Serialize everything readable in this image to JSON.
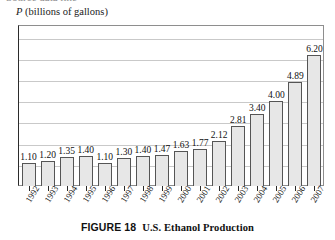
{
  "crop_strip": {
    "ghost_text": "Source data line"
  },
  "figure": {
    "label": "FIGURE 18",
    "caption": "U.S. Ethanol Production",
    "y_axis_title_symbol": "P",
    "y_axis_title_rest": " (billions of gallons)"
  },
  "style": {
    "bar_fill": "#e7e7e7",
    "bar_stroke": "#555555",
    "grid_color": "#c9c9c9",
    "axis_color": "#2b2b2b",
    "background": "#ffffff"
  },
  "chart_data": {
    "type": "bar",
    "title": "U.S. Ethanol Production",
    "xlabel": "",
    "ylabel": "P (billions of gallons)",
    "ylim": [
      0,
      7.6
    ],
    "grid": true,
    "gridlines": [
      1,
      2,
      3,
      4,
      5,
      6,
      7
    ],
    "legend": null,
    "categories": [
      "1992",
      "1993",
      "1994",
      "1995",
      "1996",
      "1997",
      "1998",
      "1999",
      "2000",
      "2001",
      "2002",
      "2003",
      "2004",
      "2005",
      "2006",
      "2007"
    ],
    "values": [
      1.1,
      1.2,
      1.35,
      1.4,
      1.1,
      1.3,
      1.4,
      1.47,
      1.63,
      1.77,
      2.12,
      2.81,
      3.4,
      4.0,
      4.89,
      6.2
    ],
    "value_labels": [
      "1.10",
      "1.20",
      "1.35",
      "1.40",
      "1.10",
      "1.30",
      "1.40",
      "1.47",
      "1.63",
      "1.77",
      "2.12",
      "2.81",
      "3.40",
      "4.00",
      "4.89",
      "6.20"
    ]
  }
}
